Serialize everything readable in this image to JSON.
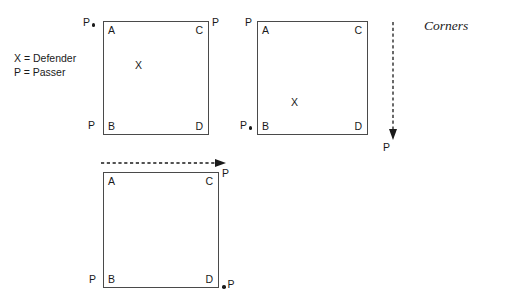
{
  "diagram": {
    "caption": "Corners",
    "legend": [
      "X = Defender",
      "P = Passer"
    ],
    "corner_letters": {
      "top_left": "A",
      "top_right": "C",
      "bottom_left": "B",
      "bottom_right": "D"
    },
    "defender_symbol": "X",
    "passer_symbol": "P",
    "courts": [
      {
        "id": "court-1",
        "name": "corner-drill-diagram-1",
        "corners": {
          "top_left": "A",
          "top_right": "C",
          "bottom_left": "B",
          "bottom_right": "D"
        },
        "defender": {
          "label": "X"
        },
        "passers": [
          {
            "label": "P",
            "position": "outside-top-left",
            "has_ball_dot": true
          },
          {
            "label": "P",
            "position": "outside-top-right",
            "has_ball_dot": false
          },
          {
            "label": "P",
            "position": "outside-bottom-left",
            "has_ball_dot": false
          }
        ],
        "arrows": []
      },
      {
        "id": "court-2",
        "name": "corner-drill-diagram-2",
        "corners": {
          "top_left": "A",
          "top_right": "C",
          "bottom_left": "B",
          "bottom_right": "D"
        },
        "defender": {
          "label": "X"
        },
        "passers": [
          {
            "label": "P",
            "position": "outside-top-left",
            "has_ball_dot": false
          },
          {
            "label": "P",
            "position": "outside-bottom-left",
            "has_ball_dot": true
          },
          {
            "label": "P",
            "position": "below-arrow-right",
            "has_ball_dot": false
          }
        ],
        "arrows": [
          {
            "direction": "down",
            "style": "dashed",
            "name": "movement-arrow-down"
          }
        ]
      },
      {
        "id": "court-3",
        "name": "corner-drill-diagram-3",
        "corners": {
          "top_left": "A",
          "top_right": "C",
          "bottom_left": "B",
          "bottom_right": "D"
        },
        "defender": null,
        "passers": [
          {
            "label": "P",
            "position": "outside-top-right",
            "has_ball_dot": false
          },
          {
            "label": "P",
            "position": "outside-bottom-left",
            "has_ball_dot": false
          },
          {
            "label": "P",
            "position": "outside-bottom-right",
            "has_ball_dot": true
          }
        ],
        "arrows": [
          {
            "direction": "right",
            "style": "dashed",
            "name": "movement-arrow-right"
          }
        ]
      }
    ]
  }
}
